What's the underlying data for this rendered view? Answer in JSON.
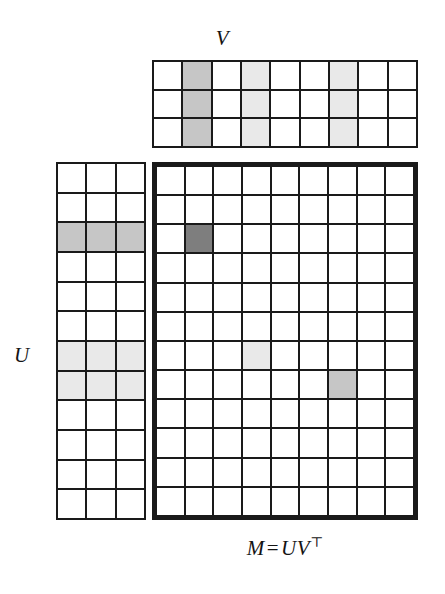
{
  "figure": {
    "background_color": "#ffffff",
    "line_color": "#1a1a1a"
  },
  "labels": {
    "v_label": "V",
    "u_label": "U",
    "m_label_lhs": "M",
    "m_label_equals": "=",
    "m_label_rhs": "UV",
    "m_label_transpose": "⊤"
  },
  "shades": {
    "none": "#ffffff",
    "light": "#e9e9e9",
    "mid": "#c6c6c6",
    "dark": "#7e7e7e"
  },
  "chart_data": {
    "type": "heatmap",
    "matrices": [
      {
        "name": "V",
        "label": "V",
        "rows": 3,
        "cols": 9,
        "border": "thin",
        "highlighted_columns": [
          {
            "index": 2,
            "shade": "mid"
          },
          {
            "index": 4,
            "shade": "light"
          },
          {
            "index": 7,
            "shade": "light"
          }
        ],
        "values": [
          [
            "none",
            "mid",
            "none",
            "light",
            "none",
            "none",
            "light",
            "none",
            "none"
          ],
          [
            "none",
            "mid",
            "none",
            "light",
            "none",
            "none",
            "light",
            "none",
            "none"
          ],
          [
            "none",
            "mid",
            "none",
            "light",
            "none",
            "none",
            "light",
            "none",
            "none"
          ]
        ]
      },
      {
        "name": "U",
        "label": "U",
        "rows": 12,
        "cols": 3,
        "border": "thin",
        "highlighted_rows": [
          {
            "index": 3,
            "shade": "mid"
          },
          {
            "index": 7,
            "shade": "light"
          },
          {
            "index": 8,
            "shade": "light"
          }
        ],
        "values": [
          [
            "none",
            "none",
            "none"
          ],
          [
            "none",
            "none",
            "none"
          ],
          [
            "mid",
            "mid",
            "mid"
          ],
          [
            "none",
            "none",
            "none"
          ],
          [
            "none",
            "none",
            "none"
          ],
          [
            "none",
            "none",
            "none"
          ],
          [
            "light",
            "light",
            "light"
          ],
          [
            "light",
            "light",
            "light"
          ],
          [
            "none",
            "none",
            "none"
          ],
          [
            "none",
            "none",
            "none"
          ],
          [
            "none",
            "none",
            "none"
          ],
          [
            "none",
            "none",
            "none"
          ]
        ]
      },
      {
        "name": "M",
        "label": "M = UV⊤",
        "rows": 12,
        "cols": 9,
        "border": "thick",
        "highlighted_cells": [
          {
            "row": 3,
            "col": 2,
            "shade": "dark"
          },
          {
            "row": 7,
            "col": 4,
            "shade": "light"
          },
          {
            "row": 8,
            "col": 7,
            "shade": "mid"
          }
        ],
        "values": [
          [
            "none",
            "none",
            "none",
            "none",
            "none",
            "none",
            "none",
            "none",
            "none"
          ],
          [
            "none",
            "none",
            "none",
            "none",
            "none",
            "none",
            "none",
            "none",
            "none"
          ],
          [
            "none",
            "dark",
            "none",
            "none",
            "none",
            "none",
            "none",
            "none",
            "none"
          ],
          [
            "none",
            "none",
            "none",
            "none",
            "none",
            "none",
            "none",
            "none",
            "none"
          ],
          [
            "none",
            "none",
            "none",
            "none",
            "none",
            "none",
            "none",
            "none",
            "none"
          ],
          [
            "none",
            "none",
            "none",
            "none",
            "none",
            "none",
            "none",
            "none",
            "none"
          ],
          [
            "none",
            "none",
            "none",
            "light",
            "none",
            "none",
            "none",
            "none",
            "none"
          ],
          [
            "none",
            "none",
            "none",
            "none",
            "none",
            "none",
            "mid",
            "none",
            "none"
          ],
          [
            "none",
            "none",
            "none",
            "none",
            "none",
            "none",
            "none",
            "none",
            "none"
          ],
          [
            "none",
            "none",
            "none",
            "none",
            "none",
            "none",
            "none",
            "none",
            "none"
          ],
          [
            "none",
            "none",
            "none",
            "none",
            "none",
            "none",
            "none",
            "none",
            "none"
          ],
          [
            "none",
            "none",
            "none",
            "none",
            "none",
            "none",
            "none",
            "none",
            "none"
          ]
        ]
      }
    ]
  }
}
